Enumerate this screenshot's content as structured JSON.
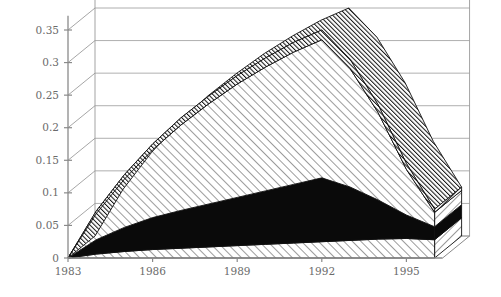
{
  "chart_data": {
    "type": "area",
    "title": "",
    "subtitle": "",
    "xlabel": "",
    "ylabel": "",
    "stacked": true,
    "three_d": true,
    "grid": true,
    "legend": "none",
    "xlim": [
      1983,
      1996
    ],
    "ylim": [
      0,
      0.375
    ],
    "x": [
      1983,
      1984,
      1985,
      1986,
      1987,
      1988,
      1989,
      1990,
      1991,
      1992,
      1993,
      1994,
      1995,
      1996
    ],
    "xticks": [
      "1983",
      "1986",
      "1989",
      "1992",
      "1995"
    ],
    "xtick_values": [
      1983,
      1986,
      1989,
      1992,
      1995
    ],
    "yticks": [
      "0",
      "0.05",
      "0.1",
      "0.15",
      "0.2",
      "0.25",
      "0.3",
      "0.35"
    ],
    "ytick_values": [
      0,
      0.05,
      0.1,
      0.15,
      0.2,
      0.25,
      0.3,
      0.35
    ],
    "series": [
      {
        "name": "series-1",
        "fill": "light-diagonal-hatch",
        "color": "#ffffff",
        "values": [
          0.0,
          0.006,
          0.01,
          0.013,
          0.015,
          0.017,
          0.019,
          0.021,
          0.023,
          0.025,
          0.027,
          0.029,
          0.03,
          0.028
        ]
      },
      {
        "name": "series-2",
        "fill": "solid-black",
        "color": "#0a0a0a",
        "values": [
          0.0,
          0.022,
          0.037,
          0.049,
          0.058,
          0.066,
          0.074,
          0.082,
          0.09,
          0.098,
          0.082,
          0.06,
          0.036,
          0.02
        ]
      },
      {
        "name": "series-3",
        "fill": "light-diagonal-hatch",
        "color": "#ffffff",
        "values": [
          0.0,
          0.04,
          0.074,
          0.104,
          0.131,
          0.154,
          0.174,
          0.19,
          0.203,
          0.212,
          0.182,
          0.134,
          0.07,
          0.022
        ]
      },
      {
        "name": "series-4",
        "fill": "dense-dark-hatch",
        "color": "#2b2b2b",
        "values": [
          0.0,
          0.004,
          0.007,
          0.009,
          0.011,
          0.012,
          0.013,
          0.014,
          0.015,
          0.015,
          0.014,
          0.012,
          0.009,
          0.005
        ]
      }
    ],
    "totals": [
      0.0,
      0.072,
      0.128,
      0.175,
      0.215,
      0.249,
      0.28,
      0.307,
      0.331,
      0.35,
      0.305,
      0.235,
      0.145,
      0.075
    ]
  },
  "axes": {
    "y_axis_name": "value-axis",
    "x_axis_name": "year-axis"
  }
}
